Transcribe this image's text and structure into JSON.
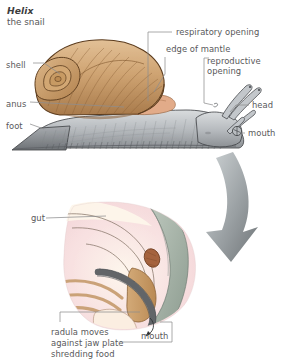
{
  "figure": {
    "title_genus": "Helix",
    "title_common": "the snail",
    "background": "#ffffff",
    "text_color": "#58585a",
    "leader_color": "#8d8d8f"
  },
  "main_diagram": {
    "name": "snail-whole-body",
    "labels": [
      {
        "id": "shell",
        "text": "shell",
        "x": 6,
        "y": 60
      },
      {
        "id": "anus",
        "text": "anus",
        "x": 6,
        "y": 99
      },
      {
        "id": "foot",
        "text": "foot",
        "x": 6,
        "y": 121
      },
      {
        "id": "respiratory-opening",
        "text": "respiratory opening",
        "x": 176,
        "y": 29
      },
      {
        "id": "edge-of-mantle",
        "text": "edge of mantle",
        "x": 166,
        "y": 47
      },
      {
        "id": "reproductive-opening-1",
        "text": "reproductive",
        "x": 207,
        "y": 60
      },
      {
        "id": "reproductive-opening-2",
        "text": "opening",
        "x": 207,
        "y": 70
      },
      {
        "id": "head",
        "text": "head",
        "x": 253,
        "y": 102
      },
      {
        "id": "mouth",
        "text": "mouth",
        "x": 248,
        "y": 131
      }
    ],
    "colors": {
      "shell_light": "#d6ad7c",
      "shell_mid": "#c29463",
      "shell_dark": "#8a5f36",
      "shell_outline": "#5c3c1e",
      "body_light": "#cfd2d4",
      "body_mid": "#a8acb0",
      "body_dark": "#76797d",
      "body_outline": "#3f4245",
      "mantle_flesh": "#e0a684"
    }
  },
  "connector": {
    "name": "zoom-arrow",
    "color": "#8f9497",
    "direction": "down-left"
  },
  "inset_diagram": {
    "name": "snail-mouth-radula-section",
    "labels": [
      {
        "id": "gut",
        "text": "gut",
        "x": 31,
        "y": 215
      },
      {
        "id": "mouth",
        "text": "mouth",
        "x": 144,
        "y": 332
      },
      {
        "id": "caption-1",
        "text": "radula moves",
        "x": 51,
        "y": 330
      },
      {
        "id": "caption-2",
        "text": "against jaw plate",
        "x": 51,
        "y": 340
      },
      {
        "id": "caption-3",
        "text": "shredding food",
        "x": 51,
        "y": 350
      }
    ],
    "colors": {
      "tissue_pink": "#f6dadd",
      "tissue_pale": "#fdf3e6",
      "tissue_cream": "#f8ebd9",
      "radula_grey": "#6f7275",
      "radula_band": "#9aa0a4",
      "odontophore": "#c79a62",
      "muscle_tan": "#c89f72",
      "sheath_green": "#aebbb0",
      "sheath_dark": "#7e8d84",
      "jaw_brown": "#a5633f",
      "outline": "#4a4c4e"
    }
  }
}
